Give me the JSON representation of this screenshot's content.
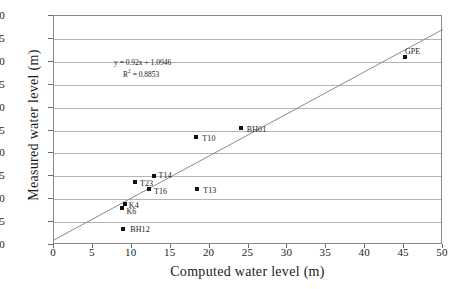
{
  "chart_data": {
    "type": "scatter",
    "title": "",
    "xlabel": "Computed water level (m)",
    "ylabel": "Measured water level (m)",
    "xlim": [
      0,
      50
    ],
    "ylim": [
      0,
      50
    ],
    "xticks": [
      0,
      5,
      10,
      15,
      20,
      25,
      30,
      35,
      40,
      45,
      50
    ],
    "yticks": [
      0,
      5,
      10,
      15,
      20,
      25,
      30,
      35,
      40,
      45,
      50
    ],
    "grid": "horizontal",
    "legend": "none",
    "point_color": "#111111",
    "trendline_color": "#8a8a8a",
    "gridline_color": "#b4b4b4",
    "points": [
      {
        "label": "BH12",
        "x": 8.9,
        "y": 3.6,
        "label_dx": 7,
        "label_dy": -3
      },
      {
        "label": "K6",
        "x": 8.8,
        "y": 8.1,
        "label_dx": 4,
        "label_dy": 0
      },
      {
        "label": "K4",
        "x": 9.1,
        "y": 9.0,
        "label_dx": 4,
        "label_dy": -2
      },
      {
        "label": "T23",
        "x": 10.4,
        "y": 13.7,
        "label_dx": 5,
        "label_dy": -2
      },
      {
        "label": "T16",
        "x": 12.2,
        "y": 12.3,
        "label_dx": 5,
        "label_dy": -1
      },
      {
        "label": "T14",
        "x": 12.8,
        "y": 15.0,
        "label_dx": 5,
        "label_dy": -4
      },
      {
        "label": "T13",
        "x": 18.4,
        "y": 12.2,
        "label_dx": 6,
        "label_dy": -2
      },
      {
        "label": "T10",
        "x": 18.3,
        "y": 23.6,
        "label_dx": 6,
        "label_dy": -2
      },
      {
        "label": "BH01",
        "x": 24.0,
        "y": 25.6,
        "label_dx": 6,
        "label_dy": -2
      },
      {
        "label": "GPE",
        "x": 45.1,
        "y": 41.0,
        "label_dx": 0,
        "label_dy": -9
      }
    ],
    "trendline": {
      "slope": 0.92,
      "intercept": 1.0946,
      "r_squared": 0.8853,
      "equation_text": "y = 0.92x + 1.0946",
      "r2_prefix": "R",
      "r2_exponent": "2",
      "r2_value": " = 0.8853"
    }
  }
}
